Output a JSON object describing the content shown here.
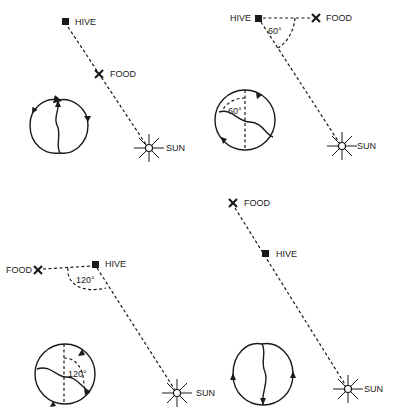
{
  "colors": {
    "ink": "#1a1a1a",
    "background": "#ffffff"
  },
  "panels": [
    {
      "id": "food-toward-sun",
      "labels": {
        "hive": "HIVE",
        "food": "FOOD",
        "sun": "SUN"
      },
      "angle_label": "",
      "dance_direction": "straight up"
    },
    {
      "id": "food-60-left-of-sun",
      "labels": {
        "hive": "HIVE",
        "food": "FOOD",
        "sun": "SUN"
      },
      "angle_label": "60°",
      "dance_angle_label": "60°"
    },
    {
      "id": "food-120-right-of-sun",
      "labels": {
        "hive": "HIVE",
        "food": "FOOD",
        "sun": "SUN"
      },
      "angle_label": "120°",
      "dance_angle_label": "120°"
    },
    {
      "id": "food-away-from-sun",
      "labels": {
        "hive": "HIVE",
        "food": "FOOD",
        "sun": "SUN"
      },
      "angle_label": "",
      "dance_direction": "straight down"
    }
  ]
}
